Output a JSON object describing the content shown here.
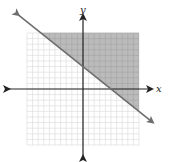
{
  "chart_data": {
    "type": "line",
    "subtype": "linear-inequality-graph",
    "title": "",
    "xlabel": "x",
    "ylabel": "y",
    "xlim": [
      -10,
      10
    ],
    "ylim": [
      -10,
      10
    ],
    "grid": true,
    "grid_step": 1,
    "tick_labels": [],
    "boundary_line": {
      "slope": -0.8,
      "y_intercept": 4,
      "x_intercept": 5,
      "equation": "y = -0.8x + 4",
      "style": "solid",
      "arrows": "both",
      "points": [
        [
          -10,
          12
        ],
        [
          10,
          -4
        ]
      ]
    },
    "shaded_region": "above boundary line (y >= -0.8x + 4), clipped to grid"
  },
  "colors": {
    "shade": "#b4b4b4",
    "grid": "#d9d9d9",
    "axis": "#222222",
    "boundary": "#6e6e6e"
  },
  "labels": {
    "x_axis": "x",
    "y_axis": "y"
  }
}
